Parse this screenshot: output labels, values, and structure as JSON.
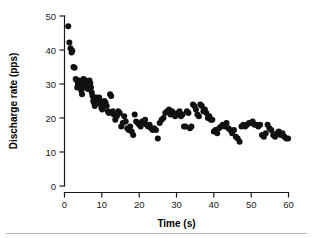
{
  "chart_data": {
    "type": "scatter",
    "title": "",
    "xlabel": "Time (s)",
    "ylabel": "Discharge rate (pps)",
    "xlim": [
      0,
      60
    ],
    "ylim": [
      0,
      50
    ],
    "xticks": [
      0,
      10,
      20,
      30,
      40,
      50,
      60
    ],
    "yticks": [
      0,
      10,
      20,
      30,
      40,
      50
    ],
    "grid": false,
    "legend": null,
    "marker": {
      "shape": "circle",
      "color": "#111111",
      "size": 3.0
    },
    "series": [
      {
        "name": "Discharge rate",
        "x": [
          1.0,
          1.3,
          1.6,
          1.9,
          2.1,
          2.4,
          2.7,
          3.0,
          3.2,
          3.4,
          3.6,
          3.9,
          4.1,
          4.3,
          4.5,
          4.7,
          4.9,
          5.1,
          5.3,
          5.5,
          5.7,
          5.9,
          6.1,
          6.3,
          6.5,
          6.7,
          6.9,
          7.1,
          7.3,
          7.5,
          7.7,
          7.9,
          8.1,
          8.3,
          8.5,
          8.7,
          8.9,
          9.1,
          9.3,
          9.5,
          9.7,
          9.9,
          10.1,
          10.4,
          10.7,
          11.0,
          11.3,
          11.6,
          11.9,
          12.2,
          12.5,
          12.9,
          13.2,
          13.6,
          14.0,
          14.4,
          14.8,
          15.2,
          15.6,
          16.0,
          16.4,
          16.8,
          17.2,
          17.6,
          18.0,
          18.4,
          18.8,
          19.2,
          19.6,
          20.0,
          20.4,
          20.8,
          21.2,
          21.6,
          22.0,
          22.4,
          22.8,
          23.2,
          23.6,
          24.0,
          24.5,
          25.0,
          25.5,
          26.0,
          26.5,
          27.0,
          27.5,
          28.0,
          28.4,
          28.8,
          29.2,
          29.6,
          30.0,
          30.4,
          30.8,
          31.2,
          31.6,
          32.0,
          32.4,
          32.8,
          33.2,
          33.6,
          34.0,
          34.4,
          34.8,
          35.2,
          35.6,
          36.0,
          36.4,
          36.8,
          37.2,
          37.6,
          38.0,
          38.4,
          38.8,
          39.2,
          39.6,
          40.0,
          40.4,
          40.9,
          41.4,
          41.9,
          42.4,
          42.9,
          43.4,
          43.9,
          44.4,
          44.9,
          45.4,
          45.9,
          46.4,
          46.9,
          47.4,
          47.9,
          48.4,
          48.9,
          49.4,
          49.9,
          50.4,
          50.9,
          51.4,
          51.9,
          52.4,
          52.9,
          53.4,
          53.9,
          54.4,
          54.9,
          55.4,
          55.9,
          56.4,
          56.9,
          57.4,
          57.9,
          58.4,
          58.9,
          59.4,
          59.9
        ],
        "y": [
          47.0,
          42.2,
          40.5,
          39.3,
          39.8,
          35.0,
          34.8,
          31.5,
          31.2,
          29.0,
          30.0,
          31.0,
          30.5,
          29.5,
          28.0,
          27.0,
          30.8,
          31.5,
          30.0,
          29.0,
          31.0,
          30.5,
          29.5,
          28.5,
          30.0,
          31.0,
          30.2,
          29.0,
          27.5,
          26.5,
          25.0,
          24.5,
          23.5,
          25.0,
          26.0,
          25.5,
          24.5,
          25.5,
          26.0,
          25.0,
          24.0,
          23.0,
          22.5,
          24.0,
          25.0,
          24.5,
          23.5,
          22.0,
          21.5,
          27.0,
          26.5,
          22.0,
          21.0,
          19.5,
          20.5,
          22.0,
          21.5,
          17.5,
          18.5,
          20.5,
          19.0,
          17.0,
          16.5,
          17.5,
          16.0,
          15.0,
          21.0,
          19.0,
          18.5,
          18.0,
          17.5,
          19.0,
          18.5,
          19.5,
          18.0,
          17.5,
          18.0,
          17.0,
          16.5,
          17.0,
          16.5,
          14.0,
          18.5,
          19.5,
          20.0,
          21.5,
          22.0,
          22.5,
          21.0,
          22.0,
          21.5,
          20.5,
          21.0,
          21.5,
          22.0,
          20.5,
          21.0,
          17.5,
          17.5,
          22.0,
          21.5,
          17.0,
          17.5,
          24.0,
          23.5,
          22.5,
          21.0,
          20.5,
          24.0,
          23.5,
          22.0,
          22.5,
          21.5,
          20.0,
          20.5,
          19.5,
          19.5,
          16.0,
          16.5,
          15.5,
          17.0,
          17.5,
          18.0,
          17.5,
          18.5,
          17.0,
          16.5,
          15.5,
          16.5,
          14.5,
          14.0,
          13.0,
          17.5,
          18.0,
          17.5,
          18.0,
          18.5,
          18.5,
          19.0,
          18.0,
          18.0,
          17.5,
          18.0,
          15.0,
          14.5,
          15.5,
          18.0,
          17.0,
          16.5,
          15.0,
          14.5,
          15.5,
          16.0,
          15.0,
          15.5,
          14.5,
          14.0,
          14.0
        ]
      }
    ]
  },
  "axes": {
    "y_title": "Discharge rate (pps)",
    "x_title": "Time (s)",
    "y_tick_labels": [
      "50",
      "40",
      "30",
      "20",
      "10",
      "0"
    ],
    "x_tick_labels": [
      "0",
      "10",
      "20",
      "30",
      "40",
      "50",
      "60"
    ]
  },
  "colors": {
    "marker": "#111111",
    "axis": "#1a1a1a",
    "rule": "#b9b9b9",
    "background": "#ffffff"
  }
}
